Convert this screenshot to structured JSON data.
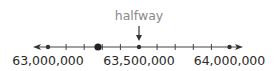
{
  "number_line": {
    "min_label": "63,000,000",
    "mid_label": "63,500,000",
    "max_label": "64,000,000",
    "callout_label": "halfway",
    "range": [
      63000000,
      64000000
    ],
    "minor_tick_step": 100000,
    "tick_values": [
      63000000,
      63100000,
      63200000,
      63300000,
      63400000,
      63500000,
      63600000,
      63700000,
      63800000,
      63900000,
      64000000
    ],
    "marked_points": [
      {
        "value": 63000000,
        "style": "small-dot"
      },
      {
        "value": 63500000,
        "style": "small-dot",
        "callout": "halfway"
      },
      {
        "value": 64000000,
        "style": "small-dot"
      },
      {
        "value": 63275000,
        "style": "large-dot"
      }
    ],
    "colors": {
      "line": "#333333",
      "labels": "#2a2a2a",
      "callout": "#8a8a8a"
    }
  }
}
